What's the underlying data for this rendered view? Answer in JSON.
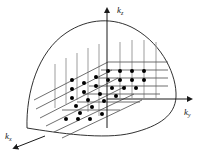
{
  "figure": {
    "name": "k-space-fermi-surface-diagram",
    "type": "3d-reciprocal-space-lattice",
    "background_color": "#ffffff",
    "axes": [
      {
        "id": "kz",
        "label": "k",
        "subscript": "z",
        "direction": "up",
        "arrow": "up"
      },
      {
        "id": "ky",
        "label": "k",
        "subscript": "y",
        "direction": "right",
        "arrow": "right"
      },
      {
        "id": "kx",
        "label": "k",
        "subscript": "x",
        "direction": "down-left",
        "arrow": "down-left"
      }
    ],
    "surface": {
      "name": "fermi-surface-boundary",
      "shape": "dome",
      "stroke_color": "#1a1a1a",
      "fill": "none"
    },
    "lattice": {
      "name": "allowed-k-point-lattice",
      "point_color": "#000000",
      "grid_line_color": "#555555",
      "vertical_line_color": "#8a8a8a",
      "columns": 6,
      "rows": 5,
      "point_radius": 2.0,
      "description": "perspective grid of quantized k states with vertical risers"
    }
  }
}
